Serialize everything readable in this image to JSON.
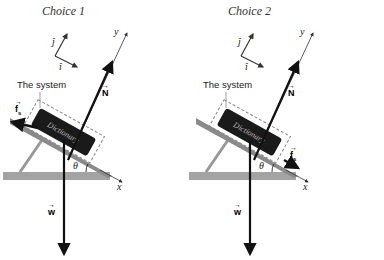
{
  "choices": [
    {
      "title": "Choice 1",
      "system_label": "The system",
      "book_label": "Dictionary",
      "labels": {
        "j_hat": "ĵ",
        "i_hat": "î",
        "y_axis": "y",
        "x_axis": "x",
        "normal": "N",
        "weight": "w",
        "friction": "f",
        "friction_sub": "s",
        "angle": "θ"
      },
      "friction_direction": "up-slope"
    },
    {
      "title": "Choice 2",
      "system_label": "The system",
      "book_label": "Dictionary",
      "labels": {
        "j_hat": "ĵ",
        "i_hat": "î",
        "y_axis": "y",
        "x_axis": "x",
        "normal": "N",
        "weight": "w",
        "friction": "f",
        "friction_sub": "s",
        "angle": "θ"
      },
      "friction_direction": "down-slope"
    }
  ],
  "colors": {
    "arrow": "#111111",
    "ramp": "#8a8a8a",
    "board": "#9a9a9a",
    "book": "#1a1a1a",
    "dashed": "#888888"
  }
}
